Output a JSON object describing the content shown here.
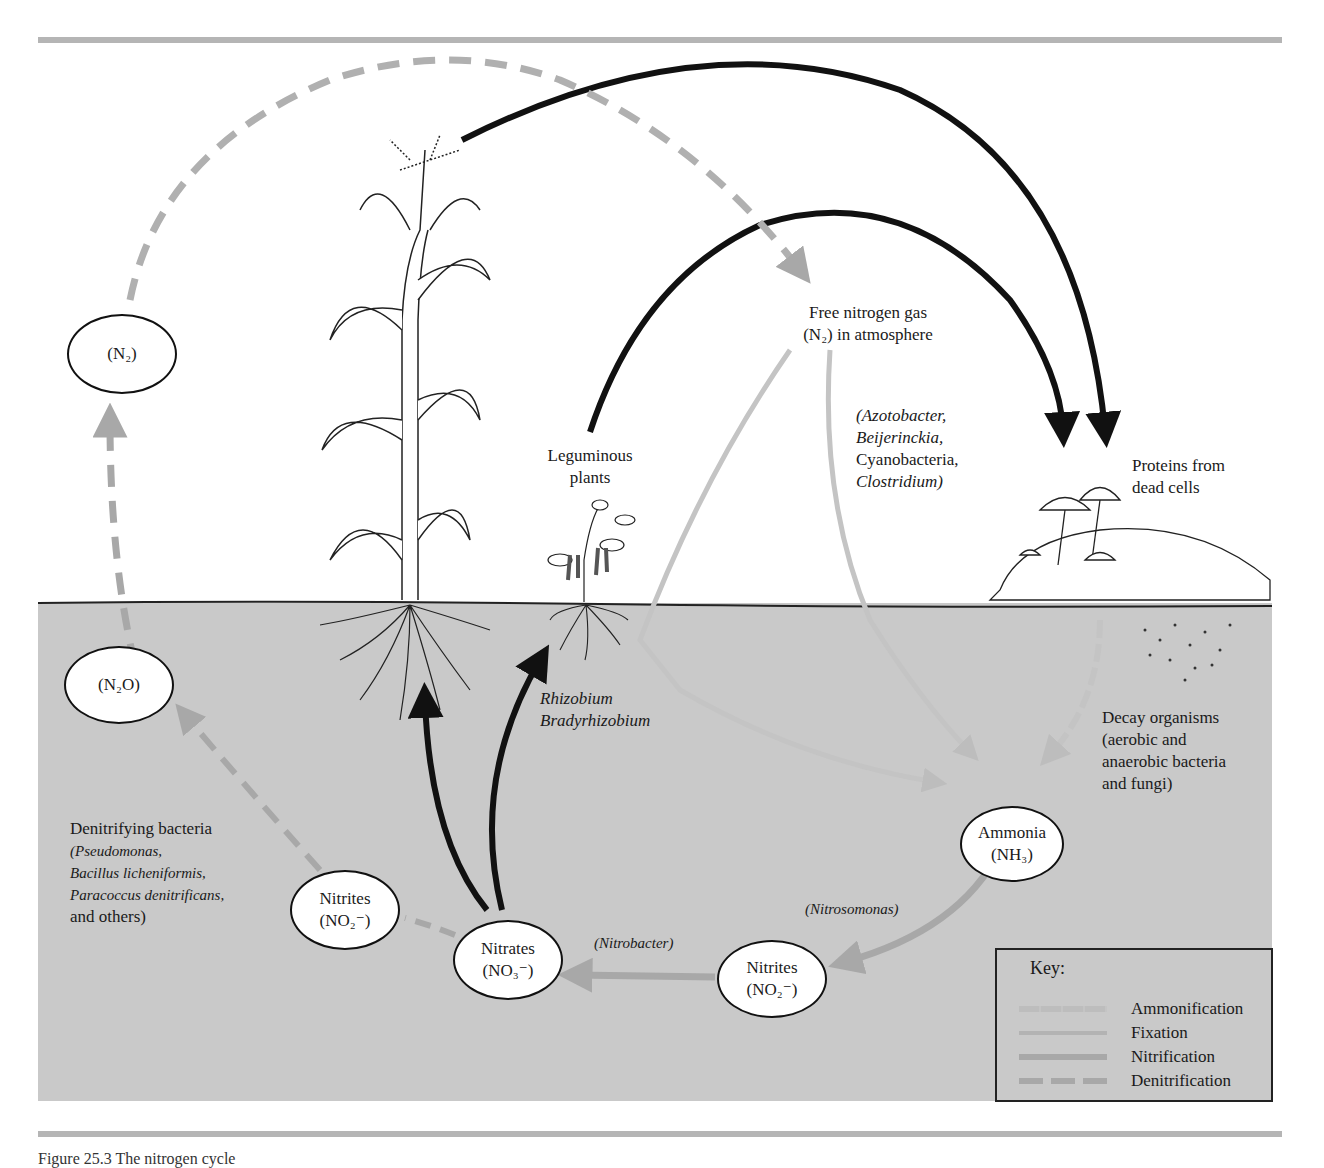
{
  "figure": {
    "caption_partial": "Figure 25.3  The nitrogen cycle",
    "atmosphere": {
      "title_line1": "Free nitrogen gas",
      "title_line2": "(N₂) in atmosphere"
    },
    "labels": {
      "leguminous_line1": "Leguminous",
      "leguminous_line2": "plants",
      "rhizobium": "Rhizobium",
      "bradyrhizobium": "Bradyrhizobium",
      "fixers_1": "(Azotobacter,",
      "fixers_2": "Beijerinckia,",
      "fixers_3": "Cyanobacteria,",
      "fixers_4": "Clostridium)",
      "proteins_line1": "Proteins from",
      "proteins_line2": "dead cells",
      "decay_1": "Decay organisms",
      "decay_2": "(aerobic and",
      "decay_3": "anaerobic bacteria",
      "decay_4": "and fungi)",
      "denitrifying_1": "Denitrifying bacteria",
      "denitrifying_2": "(Pseudomonas,",
      "denitrifying_3": "Bacillus  licheniformis,",
      "denitrifying_4": "Paracoccus denitrificans,",
      "denitrifying_5": "and others)",
      "nitrosomonas": "(Nitrosomonas)",
      "nitrobacter": "(Nitrobacter)"
    },
    "nodes": {
      "n2": "(N₂)",
      "n2o": "(N₂O)",
      "ammonia_1": "Ammonia",
      "ammonia_2": "(NH₃)",
      "nitrites_right_1": "Nitrites",
      "nitrites_right_2": "(NO₂⁻)",
      "nitrates_1": "Nitrates",
      "nitrates_2": "(NO₃⁻)",
      "nitrites_left_1": "Nitrites",
      "nitrites_left_2": "(NO₂⁻)"
    },
    "key": {
      "title": "Key:",
      "items": [
        {
          "label": "Ammonification",
          "style": "textured",
          "color": "#bdbdbd"
        },
        {
          "label": "Fixation",
          "style": "solid-light",
          "color": "#b3b3b3"
        },
        {
          "label": "Nitrification",
          "style": "solid",
          "color": "#a8a8a8"
        },
        {
          "label": "Denitrification",
          "style": "dashed",
          "color": "#a8a8a8"
        }
      ]
    },
    "colors": {
      "soil": "#c9c9c9",
      "rule": "#b5b5b5",
      "arrow_dark": "#111111",
      "arrow_gray": "#a8a8a8"
    }
  }
}
